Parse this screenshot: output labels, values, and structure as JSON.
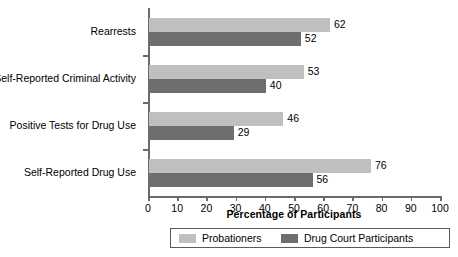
{
  "chart_data": {
    "type": "bar",
    "orientation": "horizontal",
    "title": "",
    "xlabel": "Percentage of Participants",
    "ylabel": "",
    "xlim": [
      0,
      100
    ],
    "xticks": [
      0,
      10,
      20,
      30,
      40,
      50,
      60,
      70,
      80,
      90,
      100
    ],
    "xtick_labels": [
      "0",
      "10",
      "20",
      "30",
      "40",
      "50",
      "60",
      "70",
      "80",
      "90",
      "100"
    ],
    "grid": false,
    "legend_position": "bottom",
    "categories": [
      "Rearrests",
      "Self-Reported Criminal Activity",
      "Positive Tests for Drug Use",
      "Self-Reported Drug Use"
    ],
    "series": [
      {
        "name": "Probationers",
        "color": "#bfbfbf",
        "values": [
          62,
          53,
          46,
          76
        ],
        "value_labels": [
          "62",
          "53",
          "46",
          "76"
        ]
      },
      {
        "name": "Drug Court Participants",
        "color": "#6e6e6e",
        "values": [
          52,
          40,
          29,
          56
        ],
        "value_labels": [
          "52",
          "40",
          "29",
          "56"
        ]
      }
    ],
    "axis_color": "#6b6b6b"
  }
}
